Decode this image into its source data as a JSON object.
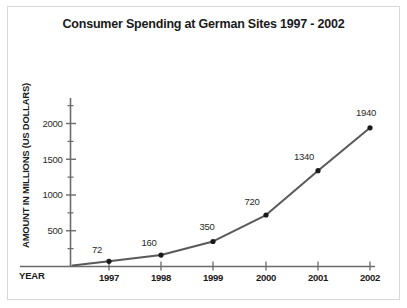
{
  "chart_data": {
    "type": "line",
    "title": "Consumer Spending at German Sites 1997 - 2002",
    "xlabel": "YEAR",
    "ylabel": "AMOUNT IN MILLIONS  (US DOLLARS)",
    "categories": [
      "1997",
      "1998",
      "1999",
      "2000",
      "2001",
      "2002"
    ],
    "values": [
      72,
      160,
      350,
      720,
      1340,
      1940
    ],
    "point_labels": [
      "72",
      "160",
      "350",
      "720",
      "1340",
      "1940"
    ],
    "yticks": [
      "500",
      "1000",
      "1500",
      "2000"
    ],
    "ytick_values": [
      500,
      1000,
      1500,
      2000
    ],
    "yminor_values": [
      250,
      750,
      1250,
      1750,
      2250
    ],
    "ylim": [
      0,
      2300
    ],
    "grid": false,
    "legend": false,
    "series": [
      {
        "name": "Consumer Spending",
        "values": [
          72,
          160,
          350,
          720,
          1340,
          1940
        ]
      }
    ],
    "colors": {
      "line": "#595959",
      "marker": "#1a1a1a",
      "axis": "#6b6b6b",
      "text": "#1a1a1a",
      "background": "#ffffff",
      "frame": "#d8d8d8"
    }
  },
  "figure": {
    "title": "Consumer Spending at German Sites 1997 - 2002",
    "ylabel": "AMOUNT IN MILLIONS  (US DOLLARS)",
    "xlabel": "YEAR",
    "ytick_labels": [
      "2000",
      "1500",
      "1000",
      "500"
    ],
    "xtick_labels": [
      "1997",
      "1998",
      "1999",
      "2000",
      "2001",
      "2002"
    ],
    "data_labels": [
      "72",
      "160",
      "350",
      "720",
      "1340",
      "1940"
    ]
  }
}
